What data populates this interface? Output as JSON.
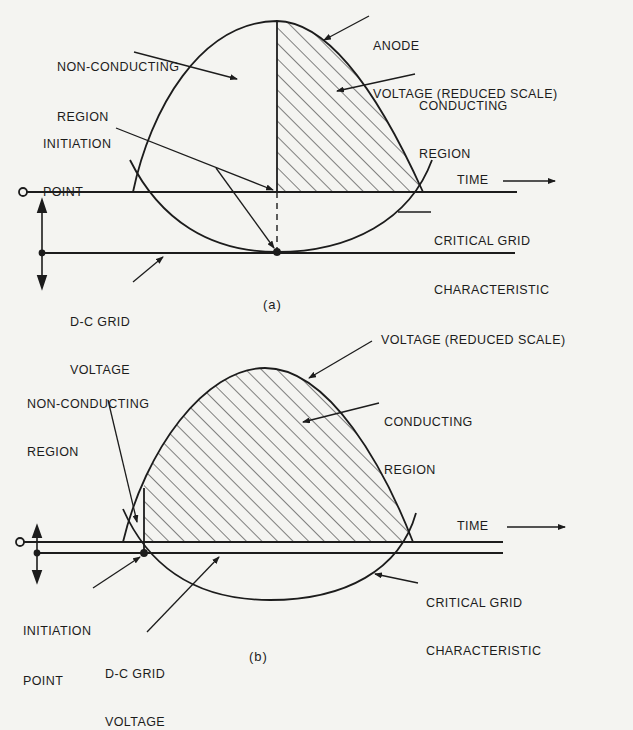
{
  "panel_a": {
    "caption": "(a)",
    "labels": {
      "non_conducting_1": "NON-CONDUCTING",
      "non_conducting_2": "REGION",
      "anode_1": "ANODE",
      "anode_2": "VOLTAGE (REDUCED SCALE)",
      "conducting_1": "CONDUCTING",
      "conducting_2": "REGION",
      "initiation_1": "INITIATION",
      "initiation_2": "POINT",
      "time": "TIME",
      "critical_1": "CRITICAL GRID",
      "critical_2": "CHARACTERISTIC",
      "dc_grid_1": "D-C GRID",
      "dc_grid_2": "VOLTAGE"
    }
  },
  "panel_b": {
    "caption": "(b)",
    "labels": {
      "voltage": "VOLTAGE (REDUCED SCALE)",
      "non_conducting_1": "NON-CONDUCTING",
      "non_conducting_2": "REGION",
      "conducting_1": "CONDUCTING",
      "conducting_2": "REGION",
      "time": "TIME",
      "critical_1": "CRITICAL GRID",
      "critical_2": "CHARACTERISTIC",
      "initiation_1": "INITIATION",
      "initiation_2": "POINT",
      "dc_grid_1": "D-C GRID",
      "dc_grid_2": "VOLTAGE"
    }
  },
  "colors": {
    "background": "#f4f4f1",
    "ink": "#1c1c1c"
  }
}
